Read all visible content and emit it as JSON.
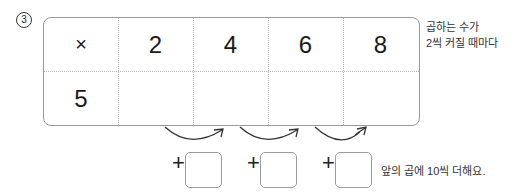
{
  "problem": {
    "number": "3",
    "table": {
      "header": [
        "×",
        "2",
        "4",
        "6",
        "8"
      ],
      "row": [
        "5",
        "",
        "",
        "",
        ""
      ]
    },
    "hint_top_lines": [
      "곱하는 수가",
      "2씩 커질 때마다"
    ],
    "increments": [
      {
        "sign": "+",
        "value": ""
      },
      {
        "sign": "+",
        "value": ""
      },
      {
        "sign": "+",
        "value": ""
      }
    ],
    "hint_bottom": "앞의 곱에 10씩 더해요."
  }
}
